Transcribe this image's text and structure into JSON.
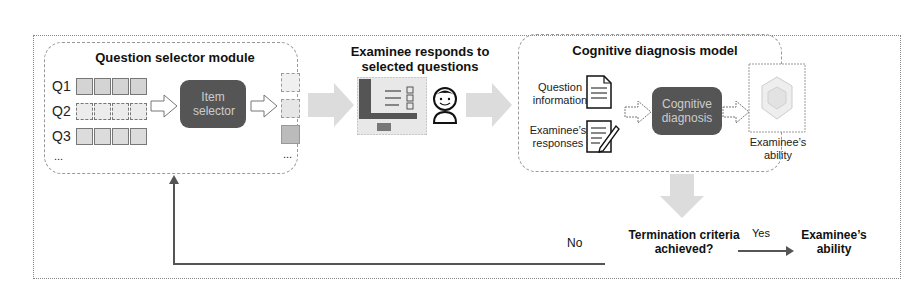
{
  "question_selector": {
    "title": "Question selector module",
    "questions": [
      "Q1",
      "Q2",
      "Q3",
      "..."
    ],
    "item_selector_label": "Item selector",
    "output_ellipsis": "..."
  },
  "examinee_step": {
    "title": "Examinee responds to selected questions"
  },
  "cognitive_model": {
    "title": "Cognitive diagnosis model",
    "input_question": "Question information",
    "input_responses": "Examinee’s responses",
    "process_label": "Cognitive diagnosis",
    "output_label": "Examinee’s ability"
  },
  "termination": {
    "question": "Termination criteria achieved?",
    "no_label": "No",
    "yes_label": "Yes",
    "final_output": "Examinee’s ability"
  },
  "colors": {
    "dark_box": "#555555",
    "arrow_fill": "#d8d8d8",
    "border": "#999999"
  }
}
